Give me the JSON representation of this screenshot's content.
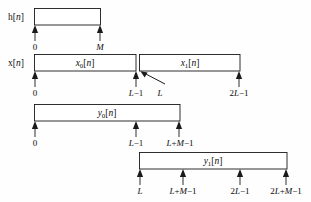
{
  "figure": {
    "type": "overlap-add-block-convolution-timeline",
    "background_color": "#fefefe",
    "line_color": "#1a1a1a",
    "text_color": "#0d0d0d"
  },
  "rows": [
    {
      "id": "h",
      "side_label": "h[n]",
      "side_label_base": "h",
      "side_label_index": "n",
      "box_label": "",
      "box_x": 34,
      "box_w": 66,
      "box_y": 8,
      "box_h": 17,
      "axis_y": 25,
      "ticks": [
        {
          "label": "0",
          "x": 35
        },
        {
          "label": "M",
          "x": 100
        }
      ]
    },
    {
      "id": "x",
      "side_label": "x[n]",
      "side_label_base": "x",
      "side_label_index": "n",
      "boxes": [
        {
          "label_base": "x",
          "label_sub": "0",
          "label_tail": "[n]",
          "x": 34,
          "w": 102
        },
        {
          "label_base": "x",
          "label_sub": "1",
          "label_tail": "[n]",
          "x": 139,
          "w": 101
        }
      ],
      "box_y": 54,
      "box_h": 17,
      "axis_y": 71,
      "ticks": [
        {
          "label": "0",
          "x": 35
        },
        {
          "label": "L−1",
          "x": 135
        },
        {
          "label": "L",
          "x": 158,
          "no_arrow": true
        },
        {
          "label": "2L−1",
          "x": 239
        }
      ],
      "pointer": {
        "from_x": 163,
        "from_y": 80,
        "to_x": 141,
        "to_y": 71
      }
    },
    {
      "id": "y0",
      "side_label": "",
      "box_label_base": "y",
      "box_label_sub": "0",
      "box_label_tail": "[n]",
      "box_x": 34,
      "box_w": 146,
      "box_y": 104,
      "box_h": 17,
      "axis_y": 121,
      "ticks": [
        {
          "label": "0",
          "x": 35
        },
        {
          "label": "L−1",
          "x": 136
        },
        {
          "label": "L+M−1",
          "x": 179
        }
      ]
    },
    {
      "id": "y1",
      "side_label": "",
      "box_label_base": "y",
      "box_label_sub": "1",
      "box_label_tail": "[n]",
      "box_x": 139,
      "box_w": 148,
      "box_y": 152,
      "box_h": 17,
      "axis_y": 169,
      "ticks": [
        {
          "label": "L",
          "x": 140
        },
        {
          "label": "L+M−1",
          "x": 183
        },
        {
          "label": "2L−1",
          "x": 240
        },
        {
          "label": "2L+M−1",
          "x": 286
        }
      ]
    }
  ],
  "labels": {
    "h_of_n": "h[n]",
    "x_of_n": "x[n]",
    "x0_of_n": "x0[n]",
    "x1_of_n": "x1[n]",
    "y0_of_n": "y0[n]",
    "y1_of_n": "y1[n]",
    "tick_0": "0",
    "tick_M": "M",
    "tick_L_minus_1": "L−1",
    "tick_L": "L",
    "tick_2L_minus_1": "2L−1",
    "tick_L_plus_M_minus_1": "L+M−1",
    "tick_2L_plus_M_minus_1": "2L+M−1"
  }
}
